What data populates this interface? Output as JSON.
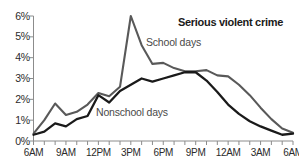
{
  "chart_data": {
    "type": "line",
    "title": "Serious violent crime",
    "xlabel": "",
    "ylabel": "",
    "ylim": [
      0,
      6
    ],
    "ytick_labels": [
      "0%",
      "1%",
      "2%",
      "3%",
      "4%",
      "5%",
      "6%"
    ],
    "ytick_values": [
      0,
      1,
      2,
      3,
      4,
      5,
      6
    ],
    "xtick_labels": [
      "6AM",
      "9AM",
      "12PM",
      "3PM",
      "6PM",
      "9PM",
      "12AM",
      "3AM",
      "6AM"
    ],
    "xtick_values": [
      0,
      3,
      6,
      9,
      12,
      15,
      18,
      21,
      24
    ],
    "x_minor_tick_step_hours": 1,
    "grid": false,
    "legend_position": "inline-annotations",
    "x": [
      0,
      1,
      2,
      3,
      4,
      5,
      6,
      7,
      8,
      9,
      10,
      11,
      12,
      13,
      14,
      15,
      16,
      17,
      18,
      19,
      20,
      21,
      22,
      23,
      24
    ],
    "x_hour_labels": [
      "6AM",
      "7AM",
      "8AM",
      "9AM",
      "10AM",
      "11AM",
      "12PM",
      "1PM",
      "2PM",
      "3PM",
      "4PM",
      "5PM",
      "6PM",
      "7PM",
      "8PM",
      "9PM",
      "10PM",
      "11PM",
      "12AM",
      "1AM",
      "2AM",
      "3AM",
      "4AM",
      "5AM",
      "6AM"
    ],
    "series": [
      {
        "name": "School days",
        "color": "#595959",
        "values": [
          0.35,
          1.0,
          1.8,
          1.25,
          1.4,
          1.75,
          2.3,
          2.15,
          2.6,
          6.0,
          4.6,
          3.7,
          3.75,
          3.5,
          3.35,
          3.35,
          3.4,
          3.15,
          3.1,
          2.7,
          2.2,
          1.6,
          1.05,
          0.6,
          0.4
        ]
      },
      {
        "name": "Nonschool days",
        "color": "#1a1a1a",
        "values": [
          0.3,
          0.45,
          0.85,
          0.7,
          1.05,
          1.2,
          2.2,
          1.85,
          2.4,
          2.7,
          3.0,
          2.85,
          3.0,
          3.15,
          3.3,
          3.3,
          2.9,
          2.35,
          1.75,
          1.3,
          0.95,
          0.7,
          0.5,
          0.3,
          0.35
        ]
      }
    ],
    "annotations": [
      {
        "text": "School days",
        "series": "School days"
      },
      {
        "text": "Nonschool days",
        "series": "Nonschool days"
      }
    ],
    "axis_color": "#8c8c8c",
    "text_color": "#2b2b2b"
  }
}
